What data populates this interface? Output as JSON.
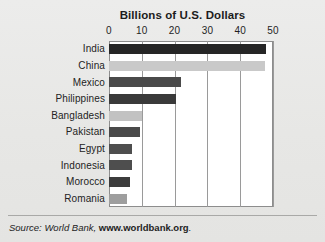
{
  "chart_data": {
    "type": "bar",
    "orientation": "horizontal",
    "title": "Billions of U.S. Dollars",
    "xlabel": "",
    "ylabel": "",
    "xlim": [
      0,
      50
    ],
    "xticks": [
      0,
      10,
      20,
      30,
      40,
      50
    ],
    "grid": true,
    "legend": null,
    "categories": [
      "India",
      "China",
      "Mexico",
      "Philippines",
      "Bangladesh",
      "Pakistan",
      "Egypt",
      "Indonesia",
      "Morocco",
      "Romania"
    ],
    "values": [
      48,
      47.5,
      22,
      20.5,
      10,
      9.5,
      7,
      7,
      6.5,
      5.5
    ],
    "bar_colors": [
      "#262626",
      "#c9c9c9",
      "#4a4a4a",
      "#3a3a3a",
      "#c2c2c2",
      "#4a4a4a",
      "#4e4e4e",
      "#4e4e4e",
      "#3c3c3c",
      "#9e9e9e"
    ],
    "bars": [
      {
        "label": "India",
        "value": 48,
        "color": "#262626"
      },
      {
        "label": "China",
        "value": 47.5,
        "color": "#c9c9c9"
      },
      {
        "label": "Mexico",
        "value": 22,
        "color": "#4a4a4a"
      },
      {
        "label": "Philippines",
        "value": 20.5,
        "color": "#3a3a3a"
      },
      {
        "label": "Bangladesh",
        "value": 10,
        "color": "#c2c2c2"
      },
      {
        "label": "Pakistan",
        "value": 9.5,
        "color": "#4a4a4a"
      },
      {
        "label": "Egypt",
        "value": 7,
        "color": "#4e4e4e"
      },
      {
        "label": "Indonesia",
        "value": 7,
        "color": "#4e4e4e"
      },
      {
        "label": "Morocco",
        "value": 6.5,
        "color": "#3c3c3c"
      },
      {
        "label": "Romania",
        "value": 5.5,
        "color": "#9e9e9e"
      }
    ]
  },
  "source": {
    "prefix": "Source: World Bank, ",
    "link_text": "www.worldbank.org",
    "suffix": "."
  },
  "colors": {
    "background": "#e9e9e7",
    "plot_background": "#ffffff",
    "axis": "#8d8d8d",
    "gridline": "#9a9a9a",
    "text": "#232323"
  }
}
